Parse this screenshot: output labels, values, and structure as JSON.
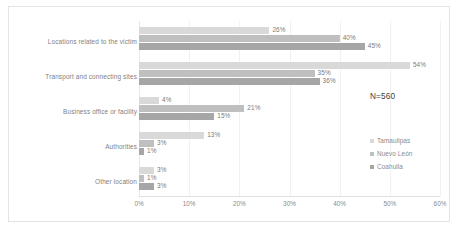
{
  "chart_data": {
    "type": "bar",
    "orientation": "horizontal",
    "title": "",
    "subtitle": "",
    "xlabel": "",
    "ylabel": "",
    "xlim": [
      0,
      60
    ],
    "xtick_labels": [
      "0%",
      "10%",
      "20%",
      "30%",
      "40%",
      "50%",
      "60%"
    ],
    "xticks": [
      0,
      10,
      20,
      30,
      40,
      50,
      60
    ],
    "grid": true,
    "legend_position": "right",
    "annotation": "N=560",
    "categories": [
      "Locations related to the victim",
      "Transport and connecting sites",
      "Business office or facility",
      "Authorities",
      "Other location"
    ],
    "series": [
      {
        "name": "Tamaulipas",
        "color": "#d9d9d9",
        "values": [
          26,
          54,
          4,
          13,
          3
        ],
        "labels": [
          "26%",
          "54%",
          "4%",
          "13%",
          "3%"
        ]
      },
      {
        "name": "Nuevo León",
        "color": "#bfbfbf",
        "values": [
          40,
          35,
          21,
          3,
          1
        ],
        "labels": [
          "40%",
          "35%",
          "21%",
          "3%",
          "1%"
        ]
      },
      {
        "name": "Coahuila",
        "color": "#a6a6a6",
        "values": [
          45,
          36,
          15,
          1,
          3
        ],
        "labels": [
          "45%",
          "36%",
          "15%",
          "1%",
          "3%"
        ]
      }
    ]
  }
}
